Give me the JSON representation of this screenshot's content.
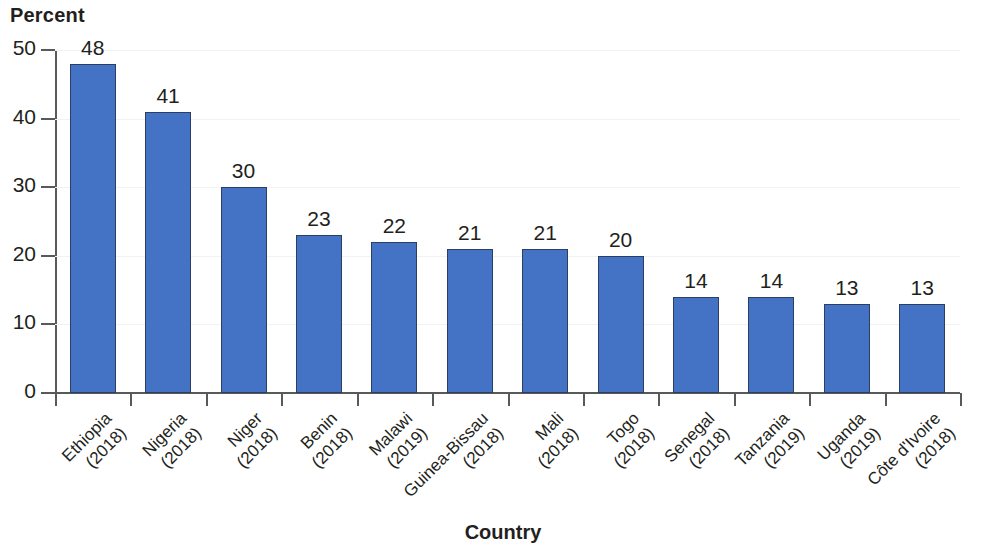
{
  "chart_data": {
    "type": "bar",
    "title": "",
    "ylabel": "Percent",
    "xlabel": "Country",
    "ylim": [
      0,
      50
    ],
    "yticks": [
      0,
      10,
      20,
      30,
      40,
      50
    ],
    "grid": true,
    "legend": "none",
    "bar_color": "#4472c4",
    "bar_border_color": "#2b3f63",
    "categories": [
      "Ethiopia (2018)",
      "Nigeria (2018)",
      "Niger (2018)",
      "Benin (2018)",
      "Malawi (2019)",
      "Guinea-Bissau (2018)",
      "Mali (2018)",
      "Togo (2018)",
      "Senegal (2018)",
      "Tanzania (2019)",
      "Uganda (2019)",
      "Côte d'Ivoire (2018)"
    ],
    "category_lines": [
      [
        "Ethiopia",
        "(2018)"
      ],
      [
        "Nigeria",
        "(2018)"
      ],
      [
        "Niger",
        "(2018)"
      ],
      [
        "Benin",
        "(2018)"
      ],
      [
        "Malawi",
        "(2019)"
      ],
      [
        "Guinea-Bissau",
        "(2018)"
      ],
      [
        "Mali",
        "(2018)"
      ],
      [
        "Togo",
        "(2018)"
      ],
      [
        "Senegal",
        "(2018)"
      ],
      [
        "Tanzania",
        "(2019)"
      ],
      [
        "Uganda",
        "(2019)"
      ],
      [
        "Côte d'Ivoire",
        "(2018)"
      ]
    ],
    "values": [
      48,
      41,
      30,
      23,
      22,
      21,
      21,
      20,
      14,
      14,
      13,
      13
    ],
    "value_labels": [
      "48",
      "41",
      "30",
      "23",
      "22",
      "21",
      "21",
      "20",
      "14",
      "14",
      "13",
      "13"
    ],
    "bar_pixel_heights": [
      343,
      290,
      212,
      162,
      157,
      150,
      148,
      140,
      99,
      95,
      90,
      88
    ],
    "ytick_labels": [
      "50",
      "40",
      "30",
      "20",
      "10",
      "0"
    ]
  }
}
